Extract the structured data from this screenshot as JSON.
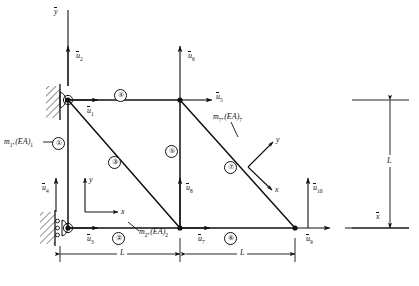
{
  "figure": {
    "type": "truss-structure-diagram",
    "global_axes": [
      {
        "name": "y-bar",
        "label": "y",
        "overbar": true,
        "orientation": "vertical"
      },
      {
        "name": "x-bar",
        "label": "x",
        "overbar": true,
        "orientation": "horizontal"
      }
    ],
    "local_axes": [
      {
        "name": "local-axes-lower-left",
        "x_label": "x",
        "y_label": "y"
      },
      {
        "name": "local-axes-member-7",
        "x_label": "x",
        "y_label": "y"
      }
    ],
    "nodes": [
      {
        "id": "n1",
        "name": "node-top-left",
        "x": 68,
        "y": 100,
        "support": "pin"
      },
      {
        "id": "n2",
        "name": "node-top-middle",
        "x": 180,
        "y": 100,
        "support": "none"
      },
      {
        "id": "n3",
        "name": "node-bottom-left",
        "x": 68,
        "y": 228,
        "support": "roller"
      },
      {
        "id": "n4",
        "name": "node-bottom-middle",
        "x": 180,
        "y": 228,
        "support": "none"
      },
      {
        "id": "n5",
        "name": "node-bottom-right",
        "x": 295,
        "y": 228,
        "support": "none"
      }
    ],
    "members": [
      {
        "number": "1",
        "label": "①",
        "from": "n1",
        "to": "n3",
        "tag_x": 58,
        "tag_y": 142
      },
      {
        "number": "2",
        "label": "②",
        "from": "n3",
        "to": "n4",
        "tag_x": 117,
        "tag_y": 229
      },
      {
        "number": "3",
        "label": "③",
        "from": "n1",
        "to": "n4",
        "tag_x": 113,
        "tag_y": 161
      },
      {
        "number": "4",
        "label": "④",
        "from": "n1",
        "to": "n2",
        "tag_x": 119,
        "tag_y": 95
      },
      {
        "number": "5",
        "label": "⑤",
        "from": "n2",
        "to": "n4",
        "tag_x": 170,
        "tag_y": 150
      },
      {
        "number": "6",
        "label": "⑥",
        "from": "n4",
        "to": "n5",
        "tag_x": 229,
        "tag_y": 229
      },
      {
        "number": "7",
        "label": "⑦",
        "from": "n2",
        "to": "n5",
        "tag_x": 229,
        "tag_y": 166
      }
    ],
    "dof_labels": [
      {
        "name": "dof-u1",
        "text": "u",
        "sub": "1",
        "x": 87,
        "y": 109,
        "direction": "right"
      },
      {
        "name": "dof-u2",
        "text": "u",
        "sub": "2",
        "x": 76,
        "y": 54,
        "direction": "up"
      },
      {
        "name": "dof-u3",
        "text": "u",
        "sub": "3",
        "x": 87,
        "y": 237,
        "direction": "right"
      },
      {
        "name": "dof-u4",
        "text": "u",
        "sub": "4",
        "x": 44,
        "y": 186,
        "direction": "up"
      },
      {
        "name": "dof-u5",
        "text": "u",
        "sub": "5",
        "x": 216,
        "y": 95,
        "direction": "right"
      },
      {
        "name": "dof-u6",
        "text": "u",
        "sub": "6",
        "x": 188,
        "y": 54,
        "direction": "up"
      },
      {
        "name": "dof-u7",
        "text": "u",
        "sub": "7",
        "x": 199,
        "y": 237,
        "direction": "right"
      },
      {
        "name": "dof-u8",
        "text": "u",
        "sub": "8",
        "x": 188,
        "y": 186,
        "direction": "up"
      },
      {
        "name": "dof-u9",
        "text": "u",
        "sub": "9",
        "x": 320,
        "y": 237,
        "direction": "right"
      },
      {
        "name": "dof-u10",
        "text": "u",
        "sub": "10",
        "x": 310,
        "y": 186,
        "direction": "up"
      }
    ],
    "property_labels": [
      {
        "name": "member-1-properties",
        "m": "m",
        "m_sub": "1",
        "ea": "(EA)",
        "ea_sub": "1",
        "x": 4,
        "y": 145
      },
      {
        "name": "member-2-properties",
        "m": "m",
        "m_sub": "2",
        "ea": "(EA)",
        "ea_sub": "2",
        "x": 137,
        "y": 234
      },
      {
        "name": "member-7-properties",
        "m": "m",
        "m_sub": "7",
        "ea": "(EA)",
        "ea_sub": "7",
        "x": 215,
        "y": 117
      }
    ],
    "dimensions": [
      {
        "name": "dimension-L-left",
        "label": "L",
        "x": 118,
        "y": 256,
        "orientation": "horizontal"
      },
      {
        "name": "dimension-L-right",
        "label": "L",
        "x": 232,
        "y": 256,
        "orientation": "horizontal"
      },
      {
        "name": "dimension-L-vertical",
        "label": "L",
        "x": 395,
        "y": 158,
        "orientation": "vertical"
      }
    ],
    "colors": {
      "ink": "#111111",
      "paper": "#ffffff",
      "hatch": "#222222"
    }
  }
}
